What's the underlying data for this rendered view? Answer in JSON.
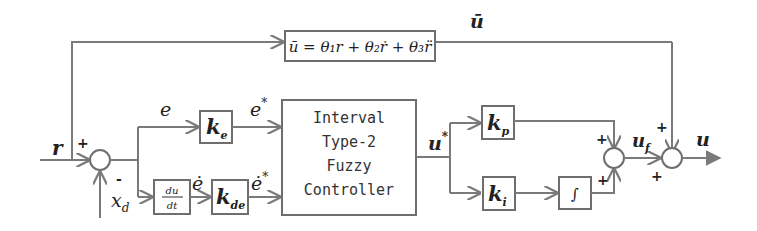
{
  "diagram": {
    "type": "control-block-diagram",
    "feedforward_block": {
      "label": "ū = θ₁r + θ₂ṙ + θ₃r̈",
      "output_label": "ū"
    },
    "input_label": "r",
    "feedback_label": "x",
    "feedback_subscript": "d",
    "sum1_signs": {
      "top": "+",
      "bottom": "-"
    },
    "error_label": "e",
    "error_dot_label": "ė",
    "derivative_block": {
      "num": "du",
      "den": "dt"
    },
    "ke_block": {
      "main": "k",
      "sub": "e"
    },
    "kde_block": {
      "main": "k",
      "sub": "de"
    },
    "scaled_error_label": "e",
    "scaled_error_dot_label": "ė",
    "star": "*",
    "controller_block": {
      "lines": [
        "Interval",
        "Type-2",
        "Fuzzy",
        "Controller"
      ]
    },
    "controller_output_label": "u",
    "kp_block": {
      "main": "k",
      "sub": "p"
    },
    "ki_block": {
      "main": "k",
      "sub": "i"
    },
    "integrator_block": {
      "symbol": "∫"
    },
    "sum2_signs": {
      "top": "+",
      "bottom": "+"
    },
    "fuzzy_output_label": "u",
    "fuzzy_output_subscript": "f",
    "sum3_signs": {
      "top": "+",
      "bottom": "+"
    },
    "output_label": "u"
  }
}
